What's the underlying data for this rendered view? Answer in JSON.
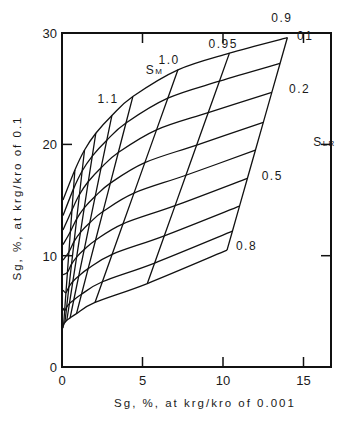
{
  "chart_data": {
    "type": "line",
    "title": "",
    "xlabel": "Sg, %, at krg/kro of 0.001",
    "ylabel": "Sg, %, at krg/kro of 0.1",
    "xlim": [
      0,
      16.5
    ],
    "ylim": [
      0,
      30
    ],
    "x_ticks": [
      0,
      5,
      10,
      15
    ],
    "x_tick_labels": [
      "0",
      "5",
      "10",
      "15"
    ],
    "y_ticks": [
      0,
      10,
      20,
      30
    ],
    "y_tick_labels": [
      "0",
      "10",
      "20",
      "30"
    ],
    "grid": false,
    "legend": "none",
    "family_labels": {
      "sm_title": "SM",
      "slr_title": "SLR"
    },
    "sm_lines": [
      {
        "label": "0.9",
        "top": [
          14.0,
          29.6
        ],
        "bottom": [
          10.25,
          10.5
        ]
      },
      {
        "label": "0.95",
        "top": [
          10.4,
          28.2
        ],
        "bottom": [
          5.3,
          7.5
        ]
      },
      {
        "label": "1.0",
        "top": [
          7.2,
          26.7
        ],
        "bottom": [
          2.05,
          5.8
        ]
      },
      {
        "label": "1.1",
        "top": [
          4.4,
          24.3
        ],
        "bottom": [
          0.9,
          4.8
        ]
      },
      {
        "label": "",
        "top": [
          3.1,
          22.6
        ],
        "bottom": [
          0.5,
          4.4
        ]
      },
      {
        "label": "",
        "top": [
          2.1,
          21.0
        ],
        "bottom": [
          0.3,
          4.2
        ]
      },
      {
        "label": "",
        "top": [
          1.4,
          19.5
        ],
        "bottom": [
          0.18,
          4.0
        ]
      },
      {
        "label": "",
        "top": [
          0.8,
          17.7
        ],
        "bottom": [
          0.1,
          3.8
        ]
      }
    ],
    "slr_curves": [
      {
        "label": "0.1",
        "t": 0.0,
        "y_intercept": 15.0
      },
      {
        "label": "",
        "t": 0.122,
        "y_intercept": 13.6
      },
      {
        "label": "0.2",
        "t": 0.258,
        "y_intercept": 12.3
      },
      {
        "label": "",
        "t": 0.399,
        "y_intercept": 11.0
      },
      {
        "label": "",
        "t": 0.53,
        "y_intercept": 9.6
      },
      {
        "label": "0.5",
        "t": 0.662,
        "y_intercept": 8.3
      },
      {
        "label": "",
        "t": 0.793,
        "y_intercept": 6.9
      },
      {
        "label": "",
        "t": 0.911,
        "y_intercept": 5.3
      },
      {
        "label": "0.8",
        "t": 1.0,
        "y_intercept": 3.5
      }
    ],
    "annotations": [
      {
        "text": "SM",
        "x": 5.2,
        "y": 26.3
      },
      {
        "text": "1.1",
        "x": 2.2,
        "y": 23.7
      },
      {
        "text": "1.0",
        "x": 6.0,
        "y": 27.2
      },
      {
        "text": "0.95",
        "x": 9.1,
        "y": 28.7
      },
      {
        "text": "0.9",
        "x": 13.0,
        "y": 31.0
      },
      {
        "text": "01",
        "x": 14.6,
        "y": 29.4
      },
      {
        "text": "0.2",
        "x": 14.1,
        "y": 24.6
      },
      {
        "text": "SLR",
        "x": 15.6,
        "y": 19.9
      },
      {
        "text": "0.5",
        "x": 12.4,
        "y": 16.8
      },
      {
        "text": "0.8",
        "x": 10.8,
        "y": 10.5
      }
    ]
  }
}
